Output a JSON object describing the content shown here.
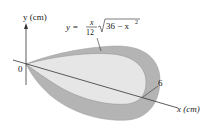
{
  "figure": {
    "y_axis_label": "y (cm)",
    "x_axis_label": "x (cm)",
    "origin_label": "0",
    "tick_label": "6",
    "equation": {
      "lhs": "y =",
      "numerator": "x",
      "denominator": "12",
      "radicand": "36 − x",
      "exponent": "2"
    },
    "colors": {
      "outer_fill": "#b4b4b4",
      "inner_fill": "#e6e6e6",
      "axis": "#333333"
    }
  }
}
